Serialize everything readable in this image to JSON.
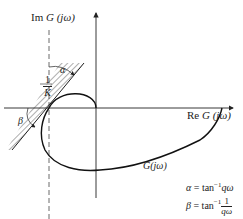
{
  "diagram": {
    "axes": {
      "imaginary_label": {
        "prefix": "Im ",
        "func": "G",
        "arg": "(jω)"
      },
      "real_label": {
        "prefix": "Re ",
        "func": "G",
        "arg": "(jω)"
      }
    },
    "curve_label": "G(jω)",
    "critical_point": {
      "numerator": "1",
      "denominator": "K",
      "sign": "−"
    },
    "angles": {
      "alpha": "α",
      "beta": "β"
    },
    "equations": {
      "alpha": {
        "lhs": "α",
        "eq": " = tan",
        "exp": "−1",
        "rhs": "qω"
      },
      "beta": {
        "lhs": "β",
        "eq": " = tan",
        "exp": "−1",
        "num": "1",
        "den": "qω"
      }
    },
    "colors": {
      "line": "#222222",
      "background": "#ffffff"
    }
  }
}
